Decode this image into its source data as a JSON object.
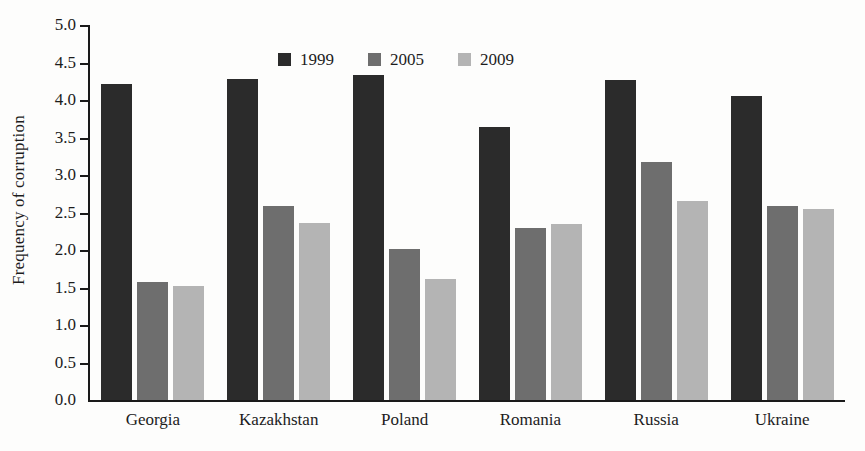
{
  "chart_data": {
    "type": "bar",
    "title": "",
    "xlabel": "",
    "ylabel": "Frequency of corruption",
    "ylim": [
      0.0,
      5.0
    ],
    "ytick_step": 0.5,
    "ytick_labels": [
      "5.0",
      "4.5",
      "4.0",
      "3.5",
      "3.0",
      "2.5",
      "2.0",
      "1.5",
      "1.0",
      "0.5",
      "0.0"
    ],
    "ytick_values": [
      5.0,
      4.5,
      4.0,
      3.5,
      3.0,
      2.5,
      2.0,
      1.5,
      1.0,
      0.5,
      0.0
    ],
    "grid": false,
    "legend_position": "top-left-inside",
    "categories": [
      "Georgia",
      "Kazakhstan",
      "Poland",
      "Romania",
      "Russia",
      "Ukraine"
    ],
    "series": [
      {
        "name": "1999",
        "color": "#2b2b2b",
        "values": [
          4.21,
          4.28,
          4.33,
          3.64,
          4.27,
          4.05
        ]
      },
      {
        "name": "2005",
        "color": "#6e6e6e",
        "values": [
          1.57,
          2.59,
          2.02,
          2.29,
          3.18,
          2.59
        ]
      },
      {
        "name": "2009",
        "color": "#b4b4b4",
        "values": [
          1.52,
          2.36,
          1.62,
          2.35,
          2.66,
          2.55
        ]
      }
    ]
  },
  "axis_color": "#1a1a1a",
  "background_color": "#fdfdfc"
}
